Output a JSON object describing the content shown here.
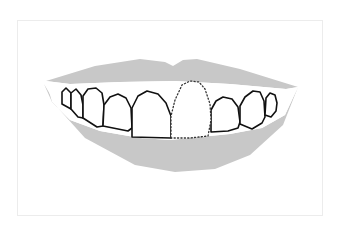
{
  "figure": {
    "colors": {
      "background": "#ffffff",
      "frame_border": "#ececec",
      "lips": "#c8c8c8",
      "tooth_fill": "#ffffff",
      "tooth_outline": "#111111",
      "missing_tooth_outline": "#333333"
    },
    "teeth": [
      {
        "id": "tooth-1",
        "state": "present"
      },
      {
        "id": "tooth-2",
        "state": "present"
      },
      {
        "id": "tooth-3",
        "state": "present"
      },
      {
        "id": "tooth-4",
        "state": "present"
      },
      {
        "id": "tooth-5",
        "state": "present"
      },
      {
        "id": "tooth-6",
        "state": "missing"
      },
      {
        "id": "tooth-7",
        "state": "present"
      },
      {
        "id": "tooth-8",
        "state": "present"
      },
      {
        "id": "tooth-9",
        "state": "present"
      }
    ]
  }
}
